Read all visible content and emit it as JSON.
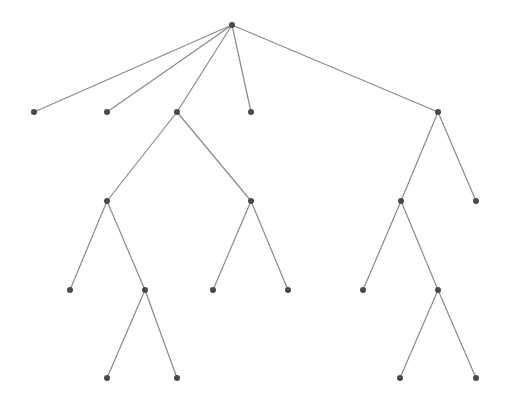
{
  "diagram": {
    "type": "tree",
    "colors": {
      "edge": "#8a8a8a",
      "node": "#4a4a4a",
      "background": "#ffffff"
    },
    "nodes": [
      {
        "id": "n0",
        "x": 232,
        "y": 25
      },
      {
        "id": "n1",
        "x": 34,
        "y": 112
      },
      {
        "id": "n2",
        "x": 107,
        "y": 112
      },
      {
        "id": "n3",
        "x": 177,
        "y": 112
      },
      {
        "id": "n4",
        "x": 251,
        "y": 112
      },
      {
        "id": "n5",
        "x": 438,
        "y": 112
      },
      {
        "id": "n6",
        "x": 107,
        "y": 201
      },
      {
        "id": "n7",
        "x": 251,
        "y": 201
      },
      {
        "id": "n8",
        "x": 401,
        "y": 201
      },
      {
        "id": "n9",
        "x": 476,
        "y": 201
      },
      {
        "id": "n10",
        "x": 70,
        "y": 290
      },
      {
        "id": "n11",
        "x": 145,
        "y": 290
      },
      {
        "id": "n12",
        "x": 213,
        "y": 290
      },
      {
        "id": "n13",
        "x": 288,
        "y": 290
      },
      {
        "id": "n14",
        "x": 363,
        "y": 290
      },
      {
        "id": "n15",
        "x": 438,
        "y": 290
      },
      {
        "id": "n16",
        "x": 107,
        "y": 378
      },
      {
        "id": "n17",
        "x": 177,
        "y": 378
      },
      {
        "id": "n18",
        "x": 400,
        "y": 378
      },
      {
        "id": "n19",
        "x": 476,
        "y": 378
      }
    ],
    "edges": [
      [
        "n0",
        "n1"
      ],
      [
        "n0",
        "n2"
      ],
      [
        "n0",
        "n3"
      ],
      [
        "n0",
        "n4"
      ],
      [
        "n0",
        "n5"
      ],
      [
        "n3",
        "n6"
      ],
      [
        "n3",
        "n7"
      ],
      [
        "n5",
        "n8"
      ],
      [
        "n5",
        "n9"
      ],
      [
        "n6",
        "n10"
      ],
      [
        "n6",
        "n11"
      ],
      [
        "n7",
        "n12"
      ],
      [
        "n7",
        "n13"
      ],
      [
        "n8",
        "n14"
      ],
      [
        "n8",
        "n15"
      ],
      [
        "n11",
        "n16"
      ],
      [
        "n11",
        "n17"
      ],
      [
        "n15",
        "n18"
      ],
      [
        "n15",
        "n19"
      ]
    ]
  }
}
